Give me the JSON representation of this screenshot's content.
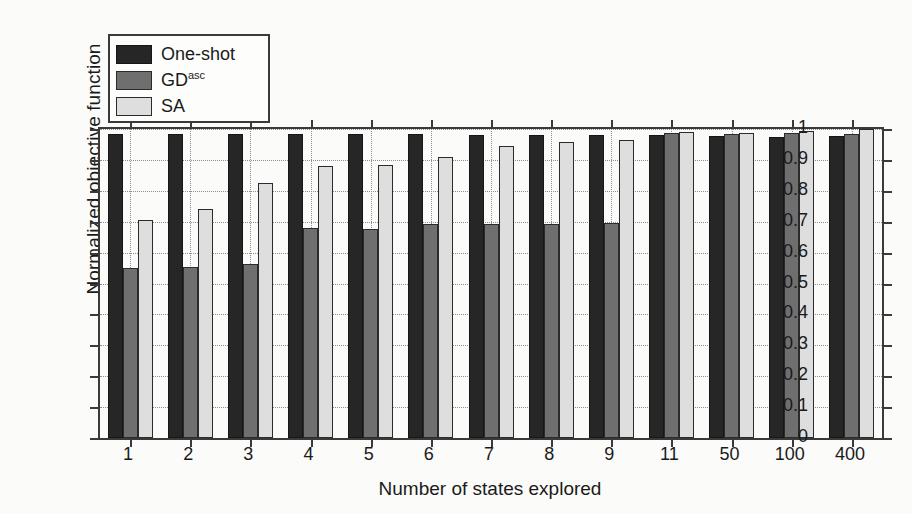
{
  "chart_data": {
    "type": "bar",
    "title": "",
    "subtitle": "",
    "xlabel": "Number of states explored",
    "ylabel": "Normalized objective function",
    "categories": [
      "1",
      "2",
      "3",
      "4",
      "5",
      "6",
      "7",
      "8",
      "9",
      "11",
      "50",
      "100",
      "400"
    ],
    "ylim": [
      0,
      1
    ],
    "ytick_labels": [
      "0",
      "0.1",
      "0.2",
      "0.3",
      "0.4",
      "0.5",
      "0.6",
      "0.7",
      "0.8",
      "0.9",
      "1"
    ],
    "ytick_values": [
      0,
      0.1,
      0.2,
      0.3,
      0.4,
      0.5,
      0.6,
      0.7,
      0.8,
      0.9,
      1
    ],
    "grid": true,
    "legend_position": "upper-left",
    "series": [
      {
        "name": "One-shot",
        "color": "#262626",
        "values": [
          0.985,
          0.985,
          0.985,
          0.985,
          0.985,
          0.985,
          0.982,
          0.98,
          0.98,
          0.982,
          0.978,
          0.975,
          0.977
        ]
      },
      {
        "name": "GD",
        "name_sup": "asc",
        "color": "#6f6f6f",
        "values": [
          0.55,
          0.552,
          0.562,
          0.68,
          0.678,
          0.692,
          0.694,
          0.694,
          0.695,
          0.988,
          0.985,
          0.988,
          0.985
        ]
      },
      {
        "name": "SA",
        "color": "#dedede",
        "values": [
          0.705,
          0.742,
          0.825,
          0.88,
          0.885,
          0.91,
          0.945,
          0.957,
          0.965,
          0.99,
          0.988,
          0.993,
          1.0
        ]
      }
    ]
  },
  "legend": {
    "items": [
      {
        "label": "One-shot",
        "sup": "",
        "color": "#262626"
      },
      {
        "label": "GD",
        "sup": "asc",
        "color": "#6f6f6f"
      },
      {
        "label": "SA",
        "sup": "",
        "color": "#dedede"
      }
    ]
  },
  "axes": {
    "y_title": "Normalized objective function",
    "x_title": "Number of states explored"
  }
}
